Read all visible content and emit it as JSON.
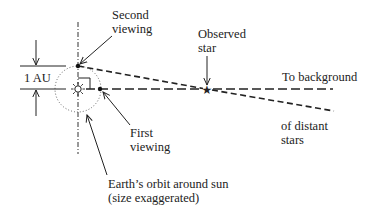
{
  "diagram": {
    "labels": {
      "second_viewing": [
        "Second",
        "viewing"
      ],
      "observed_star": [
        "Observed",
        "star"
      ],
      "to_background": "To background",
      "of_distant_stars": [
        "of distant",
        "stars"
      ],
      "first_viewing": [
        "First",
        "viewing"
      ],
      "earth_orbit": [
        "Earth’s orbit around sun",
        "(size exaggerated)"
      ],
      "au_label": "1 AU"
    },
    "elements": {
      "sun": "sun-symbol",
      "observed_star": "star-symbol",
      "second_viewing_point": "dot",
      "first_viewing_point": "dot",
      "orbit": "dotted-circle",
      "axis": "dash-dot-vertical-line",
      "line_of_sight_first": "long-dashed-line",
      "line_of_sight_second": "short-dashed-line",
      "right_angle_marker": "square-corner"
    },
    "colors": {
      "ink": "#222222",
      "background": "#ffffff"
    }
  }
}
